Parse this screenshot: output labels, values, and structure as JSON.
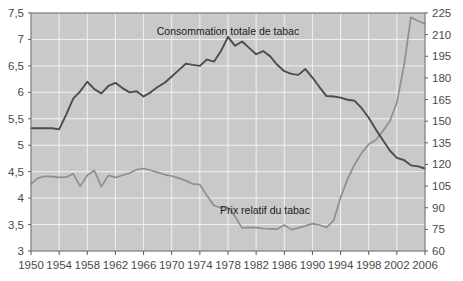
{
  "chart_data": {
    "type": "line",
    "title": "",
    "subtitle": "",
    "xlabel": "",
    "ylabel": "",
    "grid": true,
    "legend_position": "inline-annotation",
    "x": [
      1950,
      1951,
      1952,
      1953,
      1954,
      1955,
      1956,
      1957,
      1958,
      1959,
      1960,
      1961,
      1962,
      1963,
      1964,
      1965,
      1966,
      1967,
      1968,
      1969,
      1970,
      1971,
      1972,
      1973,
      1974,
      1975,
      1976,
      1977,
      1978,
      1979,
      1980,
      1981,
      1982,
      1983,
      1984,
      1985,
      1986,
      1987,
      1988,
      1989,
      1990,
      1991,
      1992,
      1993,
      1994,
      1995,
      1996,
      1997,
      1998,
      1999,
      2000,
      2001,
      2002,
      2003,
      2004,
      2005,
      2006
    ],
    "xlim": [
      1950,
      2006
    ],
    "xticks": [
      1950,
      1954,
      1958,
      1962,
      1966,
      1970,
      1974,
      1978,
      1982,
      1986,
      1990,
      1994,
      1998,
      2002,
      2006
    ],
    "xtick_labels": [
      "1950",
      "1954",
      "1958",
      "1962",
      "1966",
      "1970",
      "1974",
      "1978",
      "1982",
      "1986",
      "1990",
      "1994",
      "1998",
      "2002",
      "2006"
    ],
    "axes": [
      {
        "id": "left",
        "side": "left",
        "lim": [
          3,
          7.5
        ],
        "ticks": [
          3,
          3.5,
          4,
          4.5,
          5,
          5.5,
          6,
          6.5,
          7,
          7.5
        ],
        "tick_labels": [
          "3",
          "3,5",
          "4",
          "4,5",
          "5",
          "5,5",
          "6",
          "6,5",
          "7",
          "7,5"
        ]
      },
      {
        "id": "right",
        "side": "right",
        "lim": [
          60,
          225
        ],
        "ticks": [
          60,
          75,
          90,
          105,
          120,
          135,
          150,
          165,
          180,
          195,
          210,
          225
        ],
        "tick_labels": [
          "60",
          "75",
          "90",
          "105",
          "120",
          "135",
          "150",
          "165",
          "180",
          "195",
          "210",
          "225"
        ]
      }
    ],
    "series": [
      {
        "name": "Consommation totale de tabac",
        "axis": "left",
        "color": "#4c4c4c",
        "annotation": "Consommation totale de tabac",
        "values": [
          5.32,
          5.32,
          5.32,
          5.32,
          5.3,
          5.58,
          5.88,
          6.02,
          6.2,
          6.06,
          5.98,
          6.12,
          6.18,
          6.08,
          6.0,
          6.02,
          5.92,
          6.0,
          6.1,
          6.18,
          6.3,
          6.42,
          6.54,
          6.52,
          6.5,
          6.62,
          6.58,
          6.78,
          7.05,
          6.88,
          6.96,
          6.84,
          6.72,
          6.78,
          6.68,
          6.52,
          6.4,
          6.35,
          6.33,
          6.44,
          6.28,
          6.1,
          5.93,
          5.92,
          5.9,
          5.86,
          5.84,
          5.7,
          5.52,
          5.3,
          5.1,
          4.9,
          4.76,
          4.72,
          4.62,
          4.6,
          4.56
        ]
      },
      {
        "name": "Prix relatif du tabac",
        "axis": "right",
        "color": "#8f8f8f",
        "annotation": "Prix relatif du tabac",
        "values": [
          106.5,
          110.5,
          111.8,
          111.5,
          111.0,
          111.2,
          113.5,
          104.8,
          112.5,
          115.8,
          104.6,
          112.4,
          111.0,
          112.5,
          114.0,
          116.4,
          117.2,
          116.0,
          114.5,
          113.0,
          112.0,
          110.5,
          108.8,
          106.5,
          106.0,
          98.5,
          91.5,
          90.0,
          90.2,
          84.0,
          76.0,
          76.4,
          76.2,
          75.6,
          75.4,
          75.2,
          78.0,
          74.8,
          76.0,
          77.4,
          79.0,
          78.0,
          76.4,
          81.0,
          97.0,
          110.0,
          120.0,
          128.0,
          134.0,
          137.0,
          143.0,
          150.0,
          163.0,
          188.0,
          222.0,
          219.5,
          217.5
        ]
      }
    ],
    "annotations": [
      {
        "text": "Consommation totale de tabac",
        "x": 1975,
        "y_px_hint": "upper-middle"
      },
      {
        "text": "Prix relatif du tabac",
        "x": 1981,
        "y_px_hint": "lower-middle"
      }
    ]
  },
  "colors": {
    "plot_background": "#c9c9c9",
    "grid": "#f0f0f0",
    "frame": "#7d7d7d",
    "tick_text": "#4a4a4a",
    "consumption_line": "#4c4c4c",
    "price_line": "#8f8f8f",
    "page_background": "#ffffff"
  }
}
